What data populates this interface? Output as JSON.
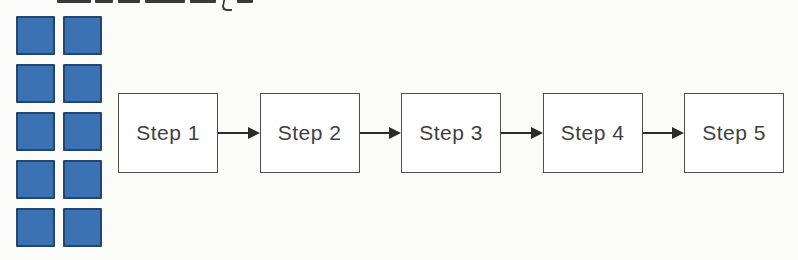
{
  "page": {
    "background": "#fbfbfa"
  },
  "cropped_heading": {
    "note": "text line cut off by top edge of image; only bottom sliver of bold characters and a 'y' descender are visible, illegible",
    "ink": "#3a3a3a",
    "segments": [
      {
        "x": 57,
        "w": 34
      },
      {
        "x": 95,
        "w": 18
      },
      {
        "x": 118,
        "w": 22
      },
      {
        "x": 145,
        "w": 40
      },
      {
        "x": 190,
        "w": 26
      },
      {
        "x": 237,
        "w": 16
      }
    ],
    "descender": {
      "x": 222,
      "w": 9,
      "h": 9
    }
  },
  "block_grid": {
    "rows": 5,
    "columns": 2,
    "square_count": 10,
    "square_fill": "#3a72b4",
    "square_border": "#24456d"
  },
  "flowchart": {
    "box_fill": "#ffffff",
    "box_border": "#4f4f4f",
    "label_color": "#3f3f3f",
    "arrow_color": "#2b2b2b",
    "steps": [
      {
        "label": "Step 1"
      },
      {
        "label": "Step 2"
      },
      {
        "label": "Step 3"
      },
      {
        "label": "Step 4"
      },
      {
        "label": "Step 5"
      }
    ]
  }
}
